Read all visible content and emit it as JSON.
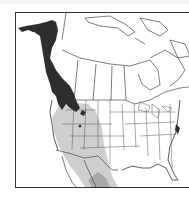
{
  "map": {
    "type": "species-range-map",
    "region": "North America",
    "colors": {
      "background": "#ffffff",
      "frame": "#333333",
      "borders": "#444444",
      "primary_range": "#2e2e2e",
      "secondary_range": "#c8c8c8",
      "secondary_range_dark": "#a8a8a8"
    },
    "legend": []
  }
}
